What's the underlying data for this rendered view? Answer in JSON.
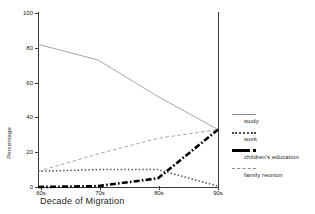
{
  "chart_data": {
    "type": "line",
    "title": "",
    "xlabel": "Decade of Migration",
    "ylabel": "Percentage",
    "categories": [
      "60s",
      "70s",
      "80s",
      "90s"
    ],
    "ylim": [
      0,
      100
    ],
    "yticks": [
      0,
      20,
      40,
      60,
      80,
      100
    ],
    "grid": false,
    "legend_position": "right",
    "series": [
      {
        "name": "study",
        "style": "thin-solid",
        "color": "#8e8e8e",
        "values": [
          82,
          73,
          52,
          33
        ]
      },
      {
        "name": "work",
        "style": "dotted",
        "color": "#4a4a4a",
        "values": [
          9,
          10,
          10,
          0.5
        ]
      },
      {
        "name": "children's education",
        "style": "thick-dash-dot",
        "color": "#000000",
        "values": [
          0,
          0.5,
          5,
          33
        ]
      },
      {
        "name": "family reunion",
        "style": "thin-dashed",
        "color": "#8e8e8e",
        "values": [
          9,
          19,
          28,
          33
        ]
      }
    ]
  },
  "axes": {
    "y_title": "Percentage",
    "x_title": "Decade of Migration",
    "y_tick_labels": [
      "100",
      "80",
      "60",
      "40",
      "20",
      "0"
    ],
    "x_tick_labels": [
      "60s",
      "70s",
      "80s",
      "90s"
    ]
  },
  "legend": {
    "items": [
      {
        "label": "study",
        "swatch": "thin-solid-line-icon"
      },
      {
        "label": "work",
        "swatch": "dotted-line-icon"
      },
      {
        "label": "children's education",
        "swatch": "thick-dash-dot-line-icon"
      },
      {
        "label": "family reunion",
        "swatch": "thin-dashed-line-icon"
      }
    ]
  },
  "artifacts": {
    "top_left_fragment": "",
    "top_right_fragment": ""
  }
}
